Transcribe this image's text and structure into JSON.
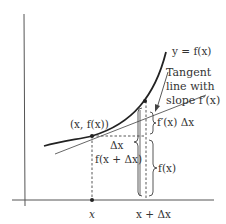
{
  "diagram": {
    "colors": {
      "ink": "#333333",
      "curve": "#222222",
      "axis": "#555555",
      "background": "#ffffff"
    },
    "labels": {
      "curve": "y = f(x)",
      "tangent_line_1": "Tangent",
      "tangent_line_2": "line with",
      "tangent_line_3": "slope f′(x)",
      "point": "(x, f(x))",
      "delta_x": "Δx",
      "f_x_plus_dx": "f(x + Δx)",
      "fprime_dx": "f′(x) Δx",
      "f_x": "f(x)",
      "tick_x": "x",
      "tick_x_plus_dx": "x + Δx"
    }
  }
}
